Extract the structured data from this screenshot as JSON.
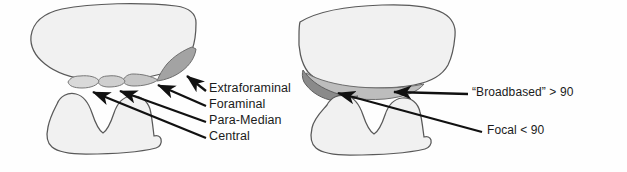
{
  "figure": {
    "type": "anatomical-diagram",
    "background": "#fefefe",
    "panels": 2
  },
  "palette": {
    "outline": "#595959",
    "body_fill": "#f1f1f1",
    "zone_light": "#d9d9d9",
    "zone_mid": "#c6c6c6",
    "zone_dark": "#a3a3a3",
    "zone_darker": "#8d8d8d",
    "broadbased_fill": "#bdbdbd",
    "focal_fill": "#8a8a8a",
    "text": "#1b1b1b",
    "arrow": "#111111"
  },
  "left_panel": {
    "name": "zone-classification-panel",
    "caption_group": "herniation zones, lateral-to-medial",
    "labels": [
      {
        "id": "extraforaminal",
        "text": "Extraforaminal",
        "x": 209,
        "y": 88
      },
      {
        "id": "foraminal",
        "text": "Foraminal",
        "x": 209,
        "y": 104
      },
      {
        "id": "para-median",
        "text": "Para-Median",
        "x": 209,
        "y": 120
      },
      {
        "id": "central",
        "text": "Central",
        "x": 209,
        "y": 136
      }
    ],
    "zones": [
      {
        "id": "extraforaminal-zone",
        "shade": "#a3a3a3"
      },
      {
        "id": "foraminal-zone",
        "shade": "#c6c6c6"
      },
      {
        "id": "para-median-zone",
        "shade": "#cfcfcf"
      },
      {
        "id": "central-zone",
        "shade": "#d9d9d9"
      }
    ],
    "arrow_count": 4
  },
  "right_panel": {
    "name": "morphology-panel",
    "caption_group": "herniation morphology by arc angle",
    "labels": [
      {
        "id": "broadbased",
        "text": "“Broadbased” > 90",
        "x": 472,
        "y": 92
      },
      {
        "id": "focal",
        "text": "Focal < 90",
        "x": 487,
        "y": 130
      }
    ],
    "zones": [
      {
        "id": "focal-zone",
        "shade": "#8a8a8a",
        "angle_deg_max": 90
      },
      {
        "id": "broadbased-zone",
        "shade": "#bdbdbd",
        "angle_deg_min": 90
      }
    ],
    "arrow_count": 2
  }
}
